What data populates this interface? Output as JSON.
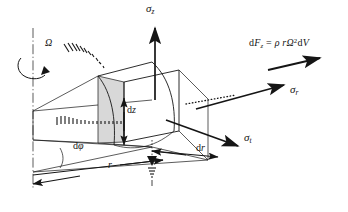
{
  "figure": {
    "background_color": "#ffffff",
    "line_color": "#151515",
    "shaded_face_color": "#d8d8d8"
  },
  "labels": {
    "sigma_z": {
      "symbol": "σ",
      "subscript": "z",
      "name": "axial-stress"
    },
    "sigma_r": {
      "symbol": "σ",
      "subscript": "r",
      "name": "radial-stress"
    },
    "sigma_t": {
      "symbol": "σ",
      "subscript": "t",
      "name": "tangential-stress"
    },
    "omega": {
      "symbol": "Ω",
      "name": "angular-velocity"
    },
    "dz": {
      "text": "d",
      "italic": "z",
      "name": "element-height"
    },
    "dr": {
      "text": "d",
      "italic": "r",
      "name": "element-radial-thickness"
    },
    "dphi": {
      "text": "d",
      "italic": "φ",
      "name": "element-angular-width"
    },
    "r": {
      "italic": "r",
      "name": "radius"
    }
  },
  "formula": {
    "lhs_d": "d",
    "lhs_F": "F",
    "lhs_sub": "z",
    "equals": "=",
    "rho": "ρ",
    "r": "r",
    "omega": "Ω",
    "exponent": "2",
    "dV_d": "d",
    "dV_V": "V",
    "plain": "dF_z = ρ rΩ²dV",
    "name": "centrifugal-force-equation"
  },
  "elements": {
    "rotation_axis": "dash-dot vertical centreline",
    "rotation_arrow": "curved arrow about axis",
    "shaded_face": "inner radial face of element",
    "hatch_leaders": "dotted hatch leader lines to element faces",
    "bottom_taper": "tapered arrow below element centre"
  }
}
